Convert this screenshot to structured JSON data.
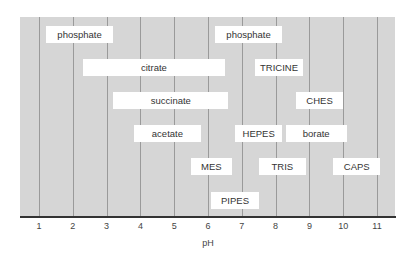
{
  "chart_data": {
    "type": "range-bar",
    "title": "",
    "xlabel": "pH",
    "ylabel": "",
    "xlim": [
      0.45,
      11.55
    ],
    "x_ticks": [
      1,
      2,
      3,
      4,
      5,
      6,
      7,
      8,
      9,
      10,
      11
    ],
    "grid": "vertical",
    "legend": "none",
    "rows": 6,
    "series": [
      {
        "name": "phosphate",
        "row": 0,
        "low": 1.2,
        "high": 3.2
      },
      {
        "name": "phosphate",
        "row": 0,
        "low": 6.2,
        "high": 8.2
      },
      {
        "name": "citrate",
        "row": 1,
        "low": 2.3,
        "high": 6.5
      },
      {
        "name": "TRICINE",
        "row": 1,
        "low": 7.4,
        "high": 8.8
      },
      {
        "name": "succinate",
        "row": 2,
        "low": 3.2,
        "high": 6.6
      },
      {
        "name": "CHES",
        "row": 2,
        "low": 8.6,
        "high": 10.0
      },
      {
        "name": "acetate",
        "row": 3,
        "low": 3.8,
        "high": 5.8
      },
      {
        "name": "HEPES",
        "row": 3,
        "low": 6.8,
        "high": 8.2
      },
      {
        "name": "borate",
        "row": 3,
        "low": 8.3,
        "high": 10.1
      },
      {
        "name": "MES",
        "row": 4,
        "low": 5.5,
        "high": 6.7
      },
      {
        "name": "TRIS",
        "row": 4,
        "low": 7.5,
        "high": 8.9
      },
      {
        "name": "CAPS",
        "row": 4,
        "low": 9.7,
        "high": 11.1
      },
      {
        "name": "PIPES",
        "row": 5,
        "low": 6.1,
        "high": 7.5
      }
    ]
  },
  "colors": {
    "plot_background": "#d6d6d6",
    "bar_fill": "#ffffff",
    "gridline": "#9a9a9a",
    "axis": "#333333",
    "text": "#333333"
  }
}
